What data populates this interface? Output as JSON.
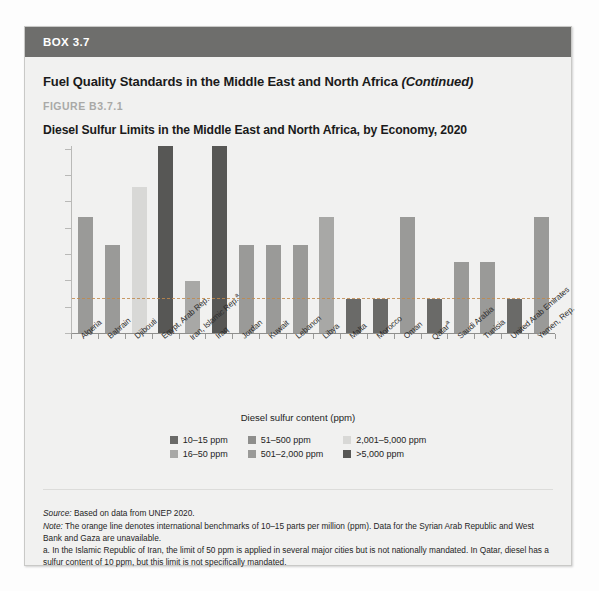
{
  "box": {
    "header_label": "BOX 3.7",
    "title_main": "Fuel Quality Standards in the Middle East and North Africa",
    "title_continued": "(Continued)",
    "figure_label": "FIGURE B3.7.1",
    "figure_title": "Diesel Sulfur Limits in the Middle East and North Africa, by Economy, 2020"
  },
  "legend": {
    "title": "Diesel sulfur content (ppm)",
    "items": [
      {
        "label": "10–15 ppm",
        "color": "#6a6a68"
      },
      {
        "label": "51–500 ppm",
        "color": "#8e8e8c"
      },
      {
        "label": "2,001–5,000 ppm",
        "color": "#d8d8d6"
      },
      {
        "label": "16–50 ppm",
        "color": "#a8a8a6"
      },
      {
        "label": "501–2,000 ppm",
        "color": "#9a9a98"
      },
      {
        "label": ">5,000 ppm",
        "color": "#575755"
      }
    ]
  },
  "notes": {
    "source_label": "Source:",
    "source_text": " Based on data from UNEP 2020.",
    "note_label": "Note:",
    "note_text": " The orange line denotes international benchmarks of 10–15 parts per million (ppm). Data for the Syrian Arab Republic and West Bank and Gaza are unavailable.",
    "footnote_a": "a. In the Islamic Republic of Iran, the limit of 50 ppm is applied in several major cities but is not nationally mandated. In Qatar, diesel has a sulfur content of 10 ppm, but this limit is not specifically mandated."
  },
  "chart_data": {
    "type": "bar",
    "title": "Diesel Sulfur Limits in the Middle East and North Africa, by Economy, 2020",
    "xlabel": "",
    "ylabel": "",
    "ylim": [
      0,
      100
    ],
    "grid": false,
    "legend_position": "bottom",
    "benchmark_line": {
      "value": 18,
      "style": "dashed",
      "color": "#c08a4e",
      "label": "10–15 ppm international benchmark"
    },
    "categories": [
      "Algeria",
      "Bahrain",
      "Djibouti",
      "Egypt, Arab Rep.",
      "Iran, Islamic Rep.a",
      "Iraq",
      "Jordan",
      "Kuwait",
      "Lebanon",
      "Libya",
      "Malta",
      "Morocco",
      "Oman",
      "Qatara",
      "Saudi Arabia",
      "Tunisia",
      "United Arab Emirates",
      "Yemen, Rep."
    ],
    "category_labels": [
      {
        "text": "Algeria",
        "sup": ""
      },
      {
        "text": "Bahrain",
        "sup": ""
      },
      {
        "text": "Djibouti",
        "sup": ""
      },
      {
        "text": "Egypt, Arab Rep.",
        "sup": ""
      },
      {
        "text": "Iran, Islamic Rep.",
        "sup": "a"
      },
      {
        "text": "Iraq",
        "sup": ""
      },
      {
        "text": "Jordan",
        "sup": ""
      },
      {
        "text": "Kuwait",
        "sup": ""
      },
      {
        "text": "Lebanon",
        "sup": ""
      },
      {
        "text": "Libya",
        "sup": ""
      },
      {
        "text": "Malta",
        "sup": ""
      },
      {
        "text": "Morocco",
        "sup": ""
      },
      {
        "text": "Oman",
        "sup": ""
      },
      {
        "text": "Qatar",
        "sup": "a"
      },
      {
        "text": "Saudi Arabia",
        "sup": ""
      },
      {
        "text": "Tunisia",
        "sup": ""
      },
      {
        "text": "United Arab Emirates",
        "sup": ""
      },
      {
        "text": "Yemen, Rep.",
        "sup": ""
      }
    ],
    "values": [
      62,
      47,
      78,
      100,
      28,
      100,
      47,
      47,
      47,
      62,
      18,
      18,
      62,
      18,
      38,
      38,
      18,
      62
    ],
    "bar_colors": [
      "#9a9a98",
      "#9a9a98",
      "#d8d8d6",
      "#575755",
      "#a8a8a6",
      "#575755",
      "#9a9a98",
      "#9a9a98",
      "#9a9a98",
      "#a8a8a6",
      "#6a6a68",
      "#6a6a68",
      "#9a9a98",
      "#6a6a68",
      "#9a9a98",
      "#9a9a98",
      "#6a6a68",
      "#9a9a98"
    ],
    "bar_categories_ppm": [
      "501–2,000 ppm",
      "501–2,000 ppm",
      "2,001–5,000 ppm",
      ">5,000 ppm",
      "16–50 ppm",
      ">5,000 ppm",
      "501–2,000 ppm",
      "501–2,000 ppm",
      "501–2,000 ppm",
      "16–50 ppm",
      "10–15 ppm",
      "10–15 ppm",
      "501–2,000 ppm",
      "10–15 ppm",
      "501–2,000 ppm",
      "501–2,000 ppm",
      "10–15 ppm",
      "501–2,000 ppm"
    ]
  }
}
